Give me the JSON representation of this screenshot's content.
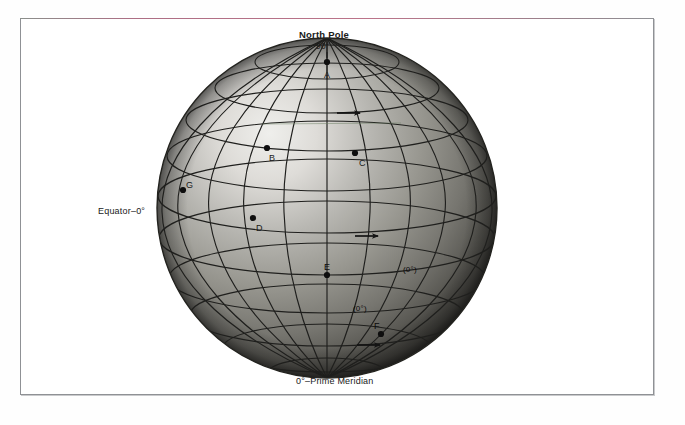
{
  "figure": {
    "type": "globe-graticule-diagram",
    "background_color": "#ffffff",
    "globe_color_light": "#e8e8e6",
    "globe_color_mid": "#8d8d8a",
    "globe_color_dark": "#3a3a38",
    "grid_color": "#1e1e1c"
  },
  "labels": {
    "north_pole": "North Pole",
    "north_pole_degrees": "90°",
    "equator": "Equator–0°",
    "prime_meridian": "0°–Prime Meridian",
    "meridian_inline_upper": "(0°)",
    "meridian_inline_lower": "(0°)"
  },
  "points": [
    {
      "id": "A",
      "label": "A",
      "x": 327,
      "y": 62,
      "label_dx": 0,
      "label_dy": 13,
      "note": "north pole"
    },
    {
      "id": "B",
      "label": "B",
      "x": 267,
      "y": 148,
      "label_dx": 3,
      "label_dy": 13,
      "note": "mid-latitude west of prime meridian"
    },
    {
      "id": "C",
      "label": "C",
      "x": 355,
      "y": 153,
      "label_dx": 5,
      "label_dy": 13,
      "note": "mid-latitude east of prime meridian"
    },
    {
      "id": "D",
      "label": "D",
      "x": 253,
      "y": 218,
      "label_dx": 4,
      "label_dy": 13,
      "note": "low latitude west"
    },
    {
      "id": "E",
      "label": "E",
      "x": 327,
      "y": 275,
      "label_dx": 0,
      "label_dy": -6,
      "note": "on prime meridian"
    },
    {
      "id": "F",
      "label": "F",
      "x": 381,
      "y": 334,
      "label_dx": -3,
      "label_dy": -6,
      "note": "southeast, lower latitude"
    },
    {
      "id": "G",
      "label": "G",
      "x": 183,
      "y": 190,
      "label_dx": 4,
      "label_dy": -5,
      "note": "western limb"
    }
  ],
  "arrows": [
    {
      "id": "arrow-1",
      "x": 337,
      "y": 113,
      "length": 26,
      "direction": "east"
    },
    {
      "id": "arrow-2",
      "x": 355,
      "y": 236,
      "length": 26,
      "direction": "east"
    },
    {
      "id": "arrow-3",
      "x": 357,
      "y": 345,
      "length": 26,
      "direction": "east"
    }
  ],
  "geometry": {
    "center_x": 327,
    "center_y": 208,
    "radius": 170,
    "meridian_count": 12,
    "parallel_count": 9,
    "polar_cap_label": "90°"
  }
}
